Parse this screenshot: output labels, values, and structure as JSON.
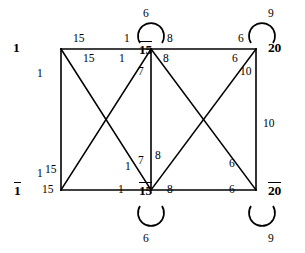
{
  "diagram": {
    "type": "weighted-graph",
    "background_color": "#ffffff",
    "stroke_color": "#000000",
    "nodes": [
      {
        "id": "n1",
        "label": "1",
        "overline": false,
        "x": 55,
        "y": 52
      },
      {
        "id": "n2",
        "label": "15",
        "overline": false,
        "x": 148,
        "y": 52
      },
      {
        "id": "n3",
        "label": "20",
        "overline": false,
        "x": 262,
        "y": 52
      },
      {
        "id": "n4",
        "label": "1",
        "overline": true,
        "x": 55,
        "y": 193
      },
      {
        "id": "n5",
        "label": "15",
        "overline": true,
        "x": 148,
        "y": 193
      },
      {
        "id": "n6",
        "label": "20",
        "overline": true,
        "x": 262,
        "y": 193
      }
    ],
    "self_loops": [
      {
        "node": "n2",
        "weight": "6",
        "side": "top"
      },
      {
        "node": "n3",
        "weight": "9",
        "side": "top"
      },
      {
        "node": "n5",
        "weight": "6",
        "side": "bottom"
      },
      {
        "node": "n6",
        "weight": "9",
        "side": "bottom"
      }
    ],
    "edges": [
      {
        "from": "n1",
        "to": "n2",
        "weights": [
          "15",
          "1"
        ]
      },
      {
        "from": "n2",
        "to": "n3",
        "weights": [
          "8",
          "6"
        ]
      },
      {
        "from": "n4",
        "to": "n5",
        "weights": [
          "15",
          "1"
        ]
      },
      {
        "from": "n5",
        "to": "n6",
        "weights": [
          "8",
          "6"
        ]
      },
      {
        "from": "n1",
        "to": "n4",
        "weights": [
          "1",
          "1"
        ]
      },
      {
        "from": "n2",
        "to": "n5",
        "weights": [
          "7",
          "7"
        ]
      },
      {
        "from": "n3",
        "to": "n6",
        "weights": [
          "10",
          "10"
        ]
      },
      {
        "from": "n1",
        "to": "n5",
        "weights": [
          "15",
          "1"
        ]
      },
      {
        "from": "n2",
        "to": "n4",
        "weights": [
          "1",
          "15"
        ]
      },
      {
        "from": "n2",
        "to": "n6",
        "weights": [
          "8",
          "6"
        ]
      },
      {
        "from": "n3",
        "to": "n5",
        "weights": [
          "6",
          "8"
        ]
      }
    ],
    "weight_labels": [
      {
        "text": "15",
        "x": 73,
        "y": 33,
        "name": "weight-top-left-horizontal-a"
      },
      {
        "text": "1",
        "x": 124,
        "y": 33,
        "name": "weight-top-left-horizontal-b"
      },
      {
        "text": "8",
        "x": 167,
        "y": 33,
        "name": "weight-top-right-horizontal-a"
      },
      {
        "text": "6",
        "x": 238,
        "y": 33,
        "name": "weight-top-right-horizontal-b"
      },
      {
        "text": "15",
        "x": 83,
        "y": 53,
        "name": "weight-diag-tl-a"
      },
      {
        "text": "1",
        "x": 119,
        "y": 53,
        "name": "weight-diag-tl-b"
      },
      {
        "text": "8",
        "x": 163,
        "y": 53,
        "name": "weight-diag-tr-a"
      },
      {
        "text": "6",
        "x": 232,
        "y": 53,
        "name": "weight-diag-tr-b"
      },
      {
        "text": "1",
        "x": 37,
        "y": 68,
        "name": "weight-left-vertical-top"
      },
      {
        "text": "7",
        "x": 138,
        "y": 66,
        "name": "weight-mid-vertical-top"
      },
      {
        "text": "10",
        "x": 240,
        "y": 66,
        "name": "weight-diag-right-10a"
      },
      {
        "text": "10",
        "x": 263,
        "y": 118,
        "name": "weight-right-vertical"
      },
      {
        "text": "1",
        "x": 37,
        "y": 168,
        "name": "weight-left-vertical-bottom"
      },
      {
        "text": "15",
        "x": 45,
        "y": 164,
        "name": "weight-diag-bl-a"
      },
      {
        "text": "1",
        "x": 125,
        "y": 161,
        "name": "weight-diag-bl-b"
      },
      {
        "text": "7",
        "x": 138,
        "y": 155,
        "name": "weight-mid-vertical-bottom"
      },
      {
        "text": "8",
        "x": 155,
        "y": 150,
        "name": "weight-diag-br-a"
      },
      {
        "text": "6",
        "x": 229,
        "y": 158,
        "name": "weight-diag-br-b"
      },
      {
        "text": "15",
        "x": 42,
        "y": 184,
        "name": "weight-bottom-left-horizontal-a"
      },
      {
        "text": "1",
        "x": 118,
        "y": 184,
        "name": "weight-bottom-left-horizontal-b"
      },
      {
        "text": "8",
        "x": 167,
        "y": 184,
        "name": "weight-bottom-right-horizontal-a"
      },
      {
        "text": "6",
        "x": 229,
        "y": 184,
        "name": "weight-bottom-right-horizontal-b"
      }
    ],
    "loop_labels": [
      {
        "text": "6",
        "x": 143,
        "y": 8,
        "name": "loop-weight-top-middle"
      },
      {
        "text": "9",
        "x": 268,
        "y": 8,
        "name": "loop-weight-top-right"
      },
      {
        "text": "6",
        "x": 143,
        "y": 233,
        "name": "loop-weight-bottom-middle"
      },
      {
        "text": "9",
        "x": 268,
        "y": 233,
        "name": "loop-weight-bottom-right"
      }
    ]
  }
}
